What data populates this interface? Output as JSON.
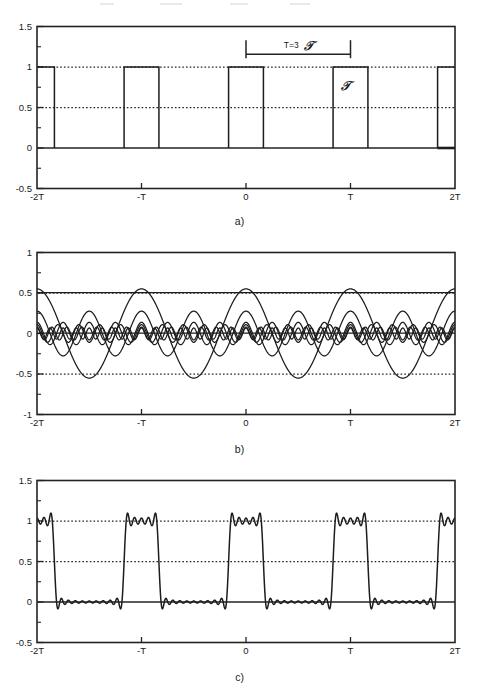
{
  "figure": {
    "background_color": "#ffffff",
    "line_color": "#1d1d1d"
  },
  "panels": [
    {
      "id": "a",
      "caption": "a)",
      "ylim": [
        -0.5,
        1.5
      ],
      "ytick_labels": [
        "1.5",
        "1",
        "0.5",
        "0",
        "-0.5"
      ],
      "ytick_values": [
        1.5,
        1,
        0.5,
        0,
        -0.5
      ],
      "yminor_values": [
        1.25,
        0.75,
        0.25,
        -0.25
      ],
      "xtick_labels": [
        "-2T",
        "-T",
        "0",
        "T",
        "2T"
      ],
      "xtick_values": [
        -2,
        -1,
        0,
        1,
        2
      ],
      "dotted_levels": [
        1,
        0.5
      ],
      "annotations": [
        {
          "name": "period-bracket-label",
          "text": "T=3",
          "tau": "T"
        },
        {
          "name": "pulse-width-label",
          "tau": "T"
        }
      ]
    },
    {
      "id": "b",
      "caption": "b)",
      "ylim": [
        -1,
        1
      ],
      "ytick_labels": [
        "1",
        "0.5",
        "0",
        "-0.5",
        "-1"
      ],
      "ytick_values": [
        1,
        0.5,
        0,
        -0.5,
        -1
      ],
      "yminor_values": [
        0.75,
        0.25,
        -0.25,
        -0.75
      ],
      "xtick_labels": [
        "-2T",
        "-T",
        "0",
        "T",
        "2T"
      ],
      "xtick_values": [
        -2,
        -1,
        0,
        1,
        2
      ],
      "dotted_levels": [
        0.5,
        -0.5
      ]
    },
    {
      "id": "c",
      "caption": "c)",
      "ylim": [
        -0.5,
        1.5
      ],
      "ytick_labels": [
        "1.5",
        "1",
        "0.5",
        "0",
        "-0.5"
      ],
      "ytick_values": [
        1.5,
        1,
        0.5,
        0,
        -0.5
      ],
      "yminor_values": [
        1.25,
        0.75,
        0.25,
        -0.25
      ],
      "xtick_labels": [
        "-2T",
        "-T",
        "0",
        "T",
        "2T"
      ],
      "xtick_values": [
        -2,
        -1,
        0,
        1,
        2
      ],
      "dotted_levels": [
        1,
        0.5
      ]
    }
  ],
  "chart_data": [
    {
      "type": "line",
      "panel": "a",
      "title": "Periodic rectangular pulse train x(t)",
      "xlabel": "",
      "ylabel": "",
      "xlim": [
        -2,
        2
      ],
      "ylim": [
        -0.5,
        1.5
      ],
      "xtick_labels": [
        "-2T",
        "-T",
        "0",
        "T",
        "2T"
      ],
      "ytick_labels": [
        "1.5",
        "1",
        "0.5",
        "0",
        "-0.5"
      ],
      "grid": false,
      "dotted_reference_lines": [
        1.0,
        0.5
      ],
      "waveform": {
        "name": "rectangular-pulse-train",
        "period_T": 1.0,
        "pulse_width_tau": 0.3333,
        "duty_cycle": 0.3333,
        "amplitude": 1.0,
        "baseline": 0.0,
        "pulse_centers": [
          -2,
          -1,
          0,
          1,
          2
        ]
      },
      "annotations": [
        {
          "text": "T=3 T",
          "x": 0.5,
          "y": 1.27,
          "type": "dimension-bracket",
          "from_x": 0.0,
          "to_x": 1.0
        },
        {
          "text": "T",
          "x": 0.96,
          "y": 0.72,
          "type": "label"
        }
      ]
    },
    {
      "type": "line",
      "panel": "b",
      "title": "Individual Fourier harmonic components",
      "xlabel": "",
      "ylabel": "",
      "xlim": [
        -2,
        2
      ],
      "ylim": [
        -1,
        1
      ],
      "xtick_labels": [
        "-2T",
        "-T",
        "0",
        "T",
        "2T"
      ],
      "ytick_labels": [
        "1",
        "0.5",
        "0",
        "-0.5",
        "-1"
      ],
      "grid": false,
      "dotted_reference_lines": [
        0.5,
        -0.5
      ],
      "series": [
        {
          "name": "DC component a0",
          "harmonic": 0,
          "amplitude": 0.3333,
          "values_note": "constant line at 1/3 plotted near 0.5 band"
        },
        {
          "name": "1st harmonic",
          "harmonic": 1,
          "amplitude": 0.551
        },
        {
          "name": "2nd harmonic",
          "harmonic": 2,
          "amplitude": 0.276
        },
        {
          "name": "3rd harmonic",
          "harmonic": 3,
          "amplitude": 0.0
        },
        {
          "name": "4th harmonic",
          "harmonic": 4,
          "amplitude": 0.138
        },
        {
          "name": "5th harmonic",
          "harmonic": 5,
          "amplitude": 0.11
        },
        {
          "name": "7th harmonic",
          "harmonic": 7,
          "amplitude": 0.079
        },
        {
          "name": "8th harmonic",
          "harmonic": 8,
          "amplitude": 0.069
        }
      ]
    },
    {
      "type": "line",
      "panel": "c",
      "title": "Partial Fourier sum reconstruction (Gibbs ringing)",
      "xlabel": "",
      "ylabel": "",
      "xlim": [
        -2,
        2
      ],
      "ylim": [
        -0.5,
        1.5
      ],
      "xtick_labels": [
        "-2T",
        "-T",
        "0",
        "T",
        "2T"
      ],
      "ytick_labels": [
        "1.5",
        "1",
        "0.5",
        "0",
        "-0.5"
      ],
      "grid": false,
      "dotted_reference_lines": [
        1.0,
        0.5
      ],
      "series": [
        {
          "name": "partial sum",
          "n_harmonics": 14,
          "overshoot": 1.09,
          "undershoot": -0.06
        }
      ]
    }
  ]
}
